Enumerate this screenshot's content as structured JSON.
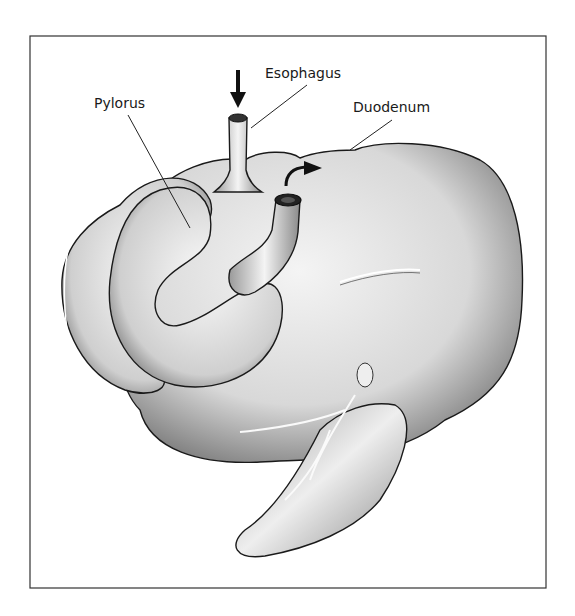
{
  "figure": {
    "labels": {
      "esophagus": "Esophagus",
      "pylorus": "Pylorus",
      "duodenum": "Duodenum"
    },
    "arrows": {
      "esophagus_inflow": "down-arrow",
      "duodenum_outflow": "curved-arrow"
    }
  }
}
